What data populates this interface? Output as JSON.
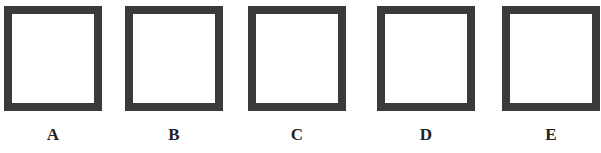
{
  "figure": {
    "options": [
      {
        "label": "A",
        "x": 4
      },
      {
        "label": "B",
        "x": 125
      },
      {
        "label": "C",
        "x": 248
      },
      {
        "label": "D",
        "x": 377
      },
      {
        "label": "E",
        "x": 502
      }
    ],
    "box_border_color": "#3a3a3a"
  }
}
